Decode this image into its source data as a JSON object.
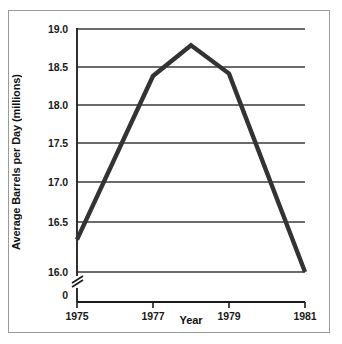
{
  "chart_data": {
    "type": "line",
    "title": "",
    "subtitle": "",
    "xlabel": "Year",
    "ylabel": "Average Barrels per Day (millions)",
    "x": [
      1975,
      1977,
      1978,
      1979,
      1981
    ],
    "values": [
      16.4,
      18.42,
      18.8,
      18.45,
      16.0
    ],
    "series": [
      {
        "name": "Average Barrels per Day",
        "values": [
          16.4,
          18.42,
          18.8,
          18.45,
          16.0
        ]
      }
    ],
    "xlim": [
      1975,
      1981
    ],
    "ylim": [
      16.0,
      19.0
    ],
    "xticks": [
      1975,
      1977,
      1979,
      1981
    ],
    "xtick_labels": [
      "1975",
      "1977",
      "1979",
      "1981"
    ],
    "yticks": [
      16.0,
      16.5,
      17.0,
      17.5,
      18.0,
      18.5,
      19.0
    ],
    "ytick_labels": [
      "16.0",
      "16.5",
      "17.0",
      "17.5",
      "18.0",
      "18.5",
      "19.0"
    ],
    "y_origin_label": "0",
    "y_axis_break": true,
    "grid": "horizontal",
    "legend": "none",
    "line_color": "#333333",
    "grid_color": "#3a3a3a",
    "axis_color": "#1a1a1a",
    "frame_color": "#9a9a9a",
    "background_color": "#ffffff"
  },
  "axis": {
    "y_labels": [
      {
        "text": "19.0",
        "value": 19.0
      },
      {
        "text": "18.5",
        "value": 18.5
      },
      {
        "text": "18.0",
        "value": 18.0
      },
      {
        "text": "17.5",
        "value": 17.5
      },
      {
        "text": "17.0",
        "value": 17.0
      },
      {
        "text": "16.5",
        "value": 16.5
      },
      {
        "text": "16.0",
        "value": 16.0
      },
      {
        "text": "0",
        "value": 0
      }
    ],
    "x_labels": [
      {
        "text": "1975",
        "value": 1975
      },
      {
        "text": "1977",
        "value": 1977
      },
      {
        "text": "1979",
        "value": 1979
      },
      {
        "text": "1981",
        "value": 1981
      }
    ]
  }
}
